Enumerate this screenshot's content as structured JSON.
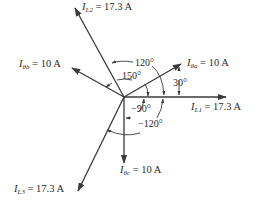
{
  "diagram": {
    "type": "phasor-diagram",
    "center": [
      124,
      97
    ],
    "colors": {
      "line": "#3a3a3a",
      "text": "#2a2a2a",
      "background": "#ffffff"
    },
    "phasors": [
      {
        "id": "IL1",
        "symbol": "I",
        "subscript": "L1",
        "value": "17.3 A",
        "angle_deg": 0
      },
      {
        "id": "Ithetaa",
        "symbol": "I",
        "subscript": "θa",
        "value": "10 A",
        "angle_deg": 30
      },
      {
        "id": "IL2",
        "symbol": "I",
        "subscript": "L2",
        "value": "17.3 A",
        "angle_deg": 120
      },
      {
        "id": "Ithetab",
        "symbol": "I",
        "subscript": "θb",
        "value": "10 A",
        "angle_deg": 150
      },
      {
        "id": "Ithetac",
        "symbol": "I",
        "subscript": "θc",
        "value": "10 A",
        "angle_deg": -90
      },
      {
        "id": "IL3",
        "symbol": "I",
        "subscript": "L3",
        "value": "17.3 A",
        "angle_deg": -120
      }
    ],
    "angle_labels": {
      "a30": "30°",
      "a120": "120°",
      "a150": "150°",
      "am90": "−90°",
      "am120": "−120°"
    },
    "equals": "="
  }
}
